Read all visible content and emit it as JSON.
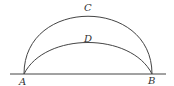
{
  "diagram": {
    "labels": {
      "A": "A",
      "B": "B",
      "C": "C",
      "D": "D"
    },
    "elements": {
      "baseline": "straight line through A and B",
      "arc_C": "large semicircular arc from A to B through C",
      "arc_D": "flatter arc from A to B through D"
    },
    "colors": {
      "stroke": "#444444",
      "text": "#333333",
      "background": "#ffffff"
    }
  }
}
